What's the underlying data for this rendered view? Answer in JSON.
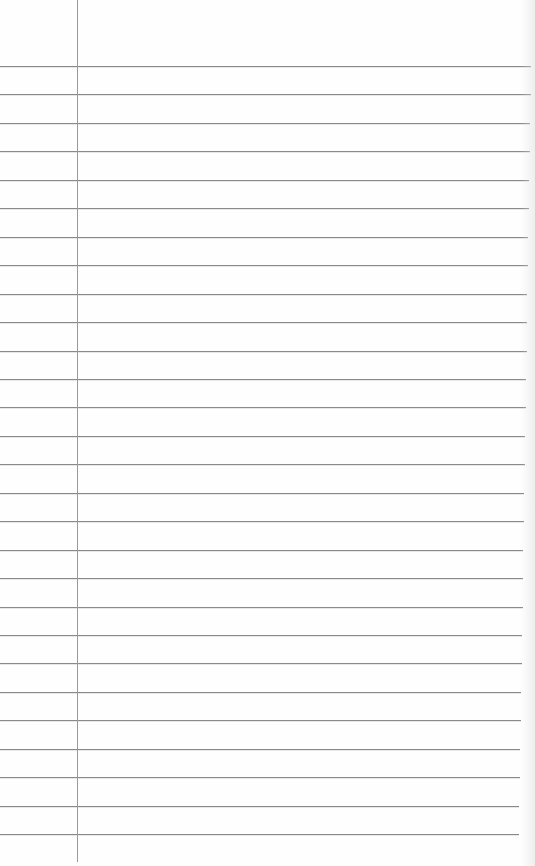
{
  "paper": {
    "type": "ruled-notebook-page",
    "background_color": "#fefefe",
    "rule_color": "#8a8a8a",
    "margin_color": "#9a9a9a",
    "first_rule_y": 66,
    "rule_spacing": 28.45,
    "rule_count": 28,
    "rule_right_top": 531,
    "rule_right_bottom": 519,
    "margin_x": 77,
    "margin_bottom": 862
  }
}
